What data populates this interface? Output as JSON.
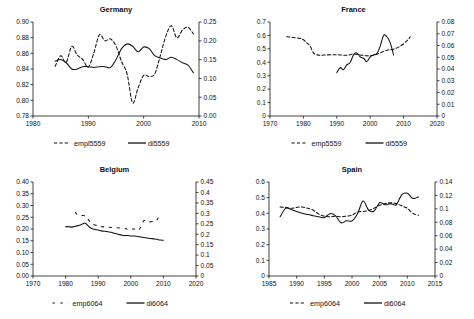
{
  "figure": {
    "panel_count": 4,
    "background": "#ffffff",
    "line_color": "#000000"
  },
  "chart_data": [
    {
      "type": "line",
      "title": "Germany",
      "xlabel": "",
      "ylabel": "",
      "grid": false,
      "legend_position": "bottom",
      "xlim": [
        1980,
        2010
      ],
      "xticks": [
        1980,
        1990,
        2000,
        2010
      ],
      "xticklabels": [
        "1980",
        "1990",
        "2000",
        "2010"
      ],
      "ylim_left": [
        0.78,
        0.9
      ],
      "yticks_left": [
        0.78,
        0.8,
        0.82,
        0.84,
        0.86,
        0.88,
        0.9
      ],
      "yticklabels_left": [
        "0.78",
        "0.80",
        "0.82",
        "0.84",
        "0.86",
        "0.88",
        "0.90"
      ],
      "ylim_right": [
        0.0,
        0.25
      ],
      "yticks_right": [
        0.0,
        0.05,
        0.1,
        0.15,
        0.2,
        0.25
      ],
      "yticklabels_right": [
        "0.00",
        "0.05",
        "0.10",
        "0.15",
        "0.20",
        "0.25"
      ],
      "series": [
        {
          "name": "empl5559",
          "style": "dashed",
          "axis": "right",
          "x": [
            1984,
            1985,
            1986,
            1987,
            1988,
            1989,
            1990,
            1991,
            1992,
            1993,
            1994,
            1995,
            1996,
            1997,
            1998,
            1999,
            2000,
            2001,
            2002,
            2003,
            2004,
            2005,
            2006,
            2007,
            2008,
            2009
          ],
          "values": [
            0.132,
            0.16,
            0.143,
            0.185,
            0.162,
            0.15,
            0.13,
            0.168,
            0.216,
            0.2,
            0.205,
            0.186,
            0.145,
            0.112,
            0.035,
            0.075,
            0.108,
            0.105,
            0.112,
            0.16,
            0.212,
            0.24,
            0.208,
            0.228,
            0.236,
            0.218
          ]
        },
        {
          "name": "di5559",
          "style": "solid",
          "axis": "left",
          "x": [
            1984,
            1985,
            1986,
            1987,
            1988,
            1989,
            1990,
            1991,
            1992,
            1993,
            1994,
            1995,
            1996,
            1997,
            1998,
            1999,
            2000,
            2001,
            2002,
            2003,
            2004,
            2005,
            2006,
            2007,
            2008,
            2009
          ],
          "values": [
            0.85,
            0.852,
            0.848,
            0.84,
            0.84,
            0.843,
            0.843,
            0.842,
            0.843,
            0.843,
            0.842,
            0.852,
            0.866,
            0.872,
            0.869,
            0.862,
            0.868,
            0.866,
            0.857,
            0.854,
            0.852,
            0.855,
            0.852,
            0.848,
            0.845,
            0.835
          ]
        }
      ]
    },
    {
      "type": "line",
      "title": "France",
      "xlabel": "",
      "ylabel": "",
      "grid": false,
      "legend_position": "bottom",
      "xlim": [
        1970,
        2020
      ],
      "xticks": [
        1970,
        1980,
        1990,
        2000,
        2010,
        2020
      ],
      "xticklabels": [
        "1970",
        "1980",
        "1990",
        "2000",
        "2010",
        "2020"
      ],
      "ylim_left": [
        0,
        0.7
      ],
      "yticks_left": [
        0,
        0.1,
        0.2,
        0.3,
        0.4,
        0.5,
        0.6,
        0.7
      ],
      "yticklabels_left": [
        "0",
        "0.1",
        "0.2",
        "0.3",
        "0.4",
        "0.5",
        "0.6",
        "0.7"
      ],
      "ylim_right": [
        0,
        0.08
      ],
      "yticks_right": [
        0,
        0.01,
        0.02,
        0.03,
        0.04,
        0.05,
        0.06,
        0.07,
        0.08
      ],
      "yticklabels_right": [
        "0",
        "0.01",
        "0.02",
        "0.03",
        "0.04",
        "0.05",
        "0.06",
        "0.07",
        "0.08"
      ],
      "series": [
        {
          "name": "emp5559",
          "style": "dashed",
          "axis": "left",
          "x": [
            1975,
            1977,
            1979,
            1980,
            1981,
            1982,
            1983,
            1984,
            1985,
            1987,
            1989,
            1991,
            1993,
            1995,
            1997,
            1999,
            2001,
            2003,
            2005,
            2007,
            2009,
            2011,
            2012
          ],
          "values": [
            0.59,
            0.585,
            0.578,
            0.568,
            0.545,
            0.52,
            0.47,
            0.456,
            0.452,
            0.455,
            0.456,
            0.455,
            0.452,
            0.462,
            0.455,
            0.448,
            0.452,
            0.47,
            0.49,
            0.498,
            0.52,
            0.56,
            0.59
          ]
        },
        {
          "name": "di5559",
          "style": "solid",
          "axis": "left",
          "x": [
            1990,
            1991,
            1992,
            1993,
            1994,
            1995,
            1996,
            1997,
            1998,
            1999,
            2000,
            2001,
            2002,
            2003,
            2004,
            2005,
            2006,
            2007
          ],
          "values": [
            0.322,
            0.36,
            0.345,
            0.38,
            0.398,
            0.455,
            0.47,
            0.44,
            0.43,
            0.405,
            0.44,
            0.455,
            0.465,
            0.52,
            0.6,
            0.59,
            0.545,
            0.455
          ]
        }
      ]
    },
    {
      "type": "line",
      "title": "Belgium",
      "xlabel": "",
      "ylabel": "",
      "grid": false,
      "legend_position": "bottom",
      "xlim": [
        1970,
        2020
      ],
      "xticks": [
        1970,
        1980,
        1990,
        2000,
        2010,
        2020
      ],
      "xticklabels": [
        "1970",
        "1980",
        "1990",
        "2000",
        "2010",
        "2020"
      ],
      "ylim_left": [
        0.0,
        0.4
      ],
      "yticks_left": [
        0.0,
        0.05,
        0.1,
        0.15,
        0.2,
        0.25,
        0.3,
        0.35,
        0.4
      ],
      "yticklabels_left": [
        "0.00",
        "0.05",
        "0.10",
        "0.15",
        "0.20",
        "0.25",
        "0.30",
        "0.35",
        "0.40"
      ],
      "ylim_right": [
        0,
        0.45
      ],
      "yticks_right": [
        0,
        0.05,
        0.1,
        0.15,
        0.2,
        0.25,
        0.3,
        0.35,
        0.4,
        0.45
      ],
      "yticklabels_right": [
        "0",
        "0.05",
        "0.1",
        "0.15",
        "0.2",
        "0.25",
        "0.3",
        "0.35",
        "0.4",
        "0.45"
      ],
      "series": [
        {
          "name": "emp6064",
          "style": "dashed-sparse",
          "axis": "right",
          "x": [
            1983,
            1984,
            1986,
            1987,
            1988,
            1990,
            1991,
            1998,
            1999,
            2001,
            2002,
            2003,
            2004,
            2005,
            2007,
            2008,
            2009
          ],
          "values": [
            0.305,
            0.29,
            0.288,
            0.27,
            0.25,
            0.24,
            0.236,
            0.228,
            0.222,
            0.225,
            0.218,
            0.232,
            0.265,
            0.258,
            0.262,
            0.268,
            0.3
          ]
        },
        {
          "name": "di6064",
          "style": "solid",
          "axis": "left",
          "x": [
            1980,
            1981,
            1982,
            1983,
            1984,
            1985,
            1986,
            1987,
            1988,
            1989,
            1990,
            1991,
            1992,
            1993,
            1994,
            1995,
            1996,
            1997,
            1998,
            1999,
            2000,
            2001,
            2002,
            2003,
            2004,
            2005,
            2006,
            2007,
            2008,
            2009,
            2010
          ],
          "values": [
            0.21,
            0.21,
            0.208,
            0.212,
            0.215,
            0.22,
            0.225,
            0.212,
            0.202,
            0.198,
            0.196,
            0.192,
            0.19,
            0.188,
            0.186,
            0.182,
            0.178,
            0.175,
            0.172,
            0.172,
            0.17,
            0.17,
            0.168,
            0.166,
            0.164,
            0.162,
            0.16,
            0.158,
            0.156,
            0.153,
            0.152
          ]
        }
      ]
    },
    {
      "type": "line",
      "title": "Spain",
      "xlabel": "",
      "ylabel": "",
      "grid": false,
      "legend_position": "bottom",
      "xlim": [
        1985,
        2015
      ],
      "xticks": [
        1985,
        1990,
        1995,
        2000,
        2005,
        2010,
        2015
      ],
      "xticklabels": [
        "1985",
        "1990",
        "1995",
        "2000",
        "2005",
        "2010",
        "2015"
      ],
      "ylim_left": [
        0,
        0.6
      ],
      "yticks_left": [
        0,
        0.1,
        0.2,
        0.3,
        0.4,
        0.5,
        0.6
      ],
      "yticklabels_left": [
        "0",
        "0.1",
        "0.2",
        "0.3",
        "0.4",
        "0.5",
        "0.6"
      ],
      "ylim_right": [
        0,
        0.14
      ],
      "yticks_right": [
        0,
        0.02,
        0.04,
        0.06,
        0.08,
        0.1,
        0.12,
        0.14
      ],
      "yticklabels_right": [
        "0",
        "0.02",
        "0.04",
        "0.06",
        "0.08",
        "0.1",
        "0.12",
        "0.14"
      ],
      "series": [
        {
          "name": "emp6064",
          "style": "dashed",
          "axis": "left",
          "x": [
            1987,
            1988,
            1989,
            1990,
            1991,
            1992,
            1993,
            1994,
            1995,
            1996,
            1997,
            1998,
            1999,
            2000,
            2001,
            2002,
            2003,
            2004,
            2005,
            2006,
            2007,
            2008,
            2009,
            2010,
            2011,
            2012
          ],
          "values": [
            0.44,
            0.438,
            0.432,
            0.438,
            0.44,
            0.432,
            0.42,
            0.395,
            0.382,
            0.378,
            0.382,
            0.378,
            0.382,
            0.388,
            0.408,
            0.412,
            0.418,
            0.432,
            0.452,
            0.462,
            0.468,
            0.462,
            0.448,
            0.432,
            0.4,
            0.388
          ]
        },
        {
          "name": "di6064",
          "style": "solid",
          "axis": "left",
          "x": [
            1987,
            1988,
            1989,
            1990,
            1991,
            1992,
            1993,
            1994,
            1995,
            1996,
            1997,
            1998,
            1999,
            2000,
            2001,
            2002,
            2003,
            2004,
            2005,
            2006,
            2007,
            2008,
            2009,
            2010,
            2011,
            2012
          ],
          "values": [
            0.378,
            0.432,
            0.425,
            0.412,
            0.4,
            0.392,
            0.385,
            0.378,
            0.372,
            0.398,
            0.385,
            0.34,
            0.352,
            0.352,
            0.398,
            0.478,
            0.42,
            0.415,
            0.468,
            0.455,
            0.462,
            0.455,
            0.52,
            0.528,
            0.495,
            0.505
          ]
        }
      ]
    }
  ]
}
